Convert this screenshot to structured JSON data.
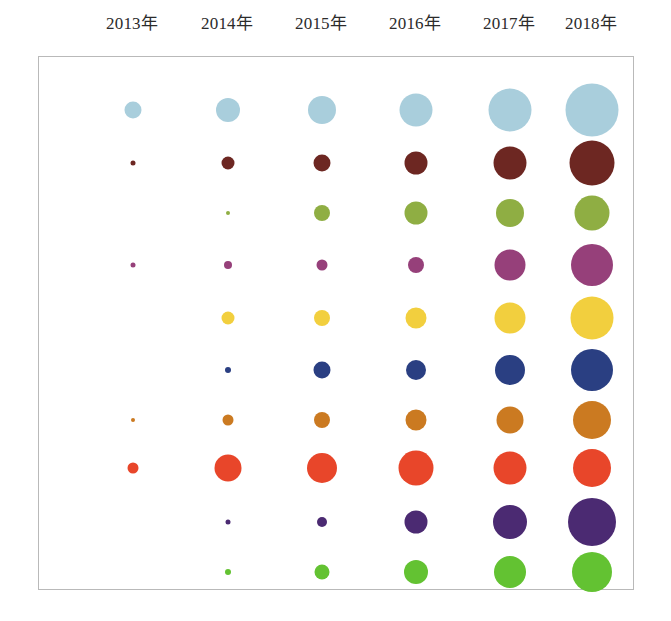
{
  "header": {
    "years": [
      "2013年",
      "2014年",
      "2015年",
      "2016年",
      "2017年",
      "2018年"
    ]
  },
  "chart_data": {
    "type": "scatter",
    "title": "",
    "subtitle": "",
    "xlabel": "",
    "ylabel": "",
    "legend_position": "none",
    "grid": false,
    "note": "Bubble matrix: 10 categories (rows) x 6 years (columns); marker area encodes magnitude",
    "categories": [
      "2013年",
      "2014年",
      "2015年",
      "2016年",
      "2017年",
      "2018年"
    ],
    "x_positions": [
      132,
      227,
      321,
      415,
      509,
      591
    ],
    "y_positions": [
      109,
      162,
      212,
      264,
      317,
      369,
      419,
      467,
      521,
      571
    ],
    "axis_ranges": {
      "x": [
        38,
        634
      ],
      "y": [
        56,
        590
      ]
    },
    "series": [
      {
        "name": "series-1",
        "color": "#a9cedc",
        "row": 1,
        "values": [
          17,
          24,
          28,
          33,
          43,
          53
        ],
        "diameters": [
          17,
          24,
          28,
          33,
          43,
          53
        ]
      },
      {
        "name": "series-2",
        "color": "#6d2722",
        "row": 2,
        "values": [
          5,
          13,
          17,
          23,
          33,
          45
        ],
        "diameters": [
          5,
          13,
          17,
          23,
          33,
          45
        ]
      },
      {
        "name": "series-3",
        "color": "#8fae43",
        "row": 3,
        "values": [
          0,
          4,
          16,
          23,
          28,
          35
        ],
        "diameters": [
          0,
          4,
          16,
          23,
          28,
          35
        ]
      },
      {
        "name": "series-4",
        "color": "#96407a",
        "row": 4,
        "values": [
          5,
          8,
          11,
          16,
          31,
          42
        ],
        "diameters": [
          5,
          8,
          11,
          16,
          31,
          42
        ]
      },
      {
        "name": "series-5",
        "color": "#f2cf3e",
        "row": 5,
        "values": [
          0,
          13,
          16,
          21,
          31,
          43
        ],
        "diameters": [
          0,
          13,
          16,
          21,
          31,
          43
        ]
      },
      {
        "name": "series-6",
        "color": "#2a3f82",
        "row": 6,
        "values": [
          0,
          6,
          17,
          20,
          30,
          42
        ],
        "diameters": [
          0,
          6,
          17,
          20,
          30,
          42
        ]
      },
      {
        "name": "series-7",
        "color": "#cb7a21",
        "row": 7,
        "values": [
          4,
          11,
          16,
          21,
          27,
          38
        ],
        "diameters": [
          4,
          11,
          16,
          21,
          27,
          38
        ]
      },
      {
        "name": "series-8",
        "color": "#e8462a",
        "row": 8,
        "values": [
          11,
          27,
          30,
          35,
          33,
          38
        ],
        "diameters": [
          11,
          27,
          30,
          35,
          33,
          38
        ]
      },
      {
        "name": "series-9",
        "color": "#4b2a72",
        "row": 9,
        "values": [
          0,
          5,
          10,
          23,
          34,
          48
        ],
        "diameters": [
          0,
          5,
          10,
          23,
          34,
          48
        ]
      },
      {
        "name": "series-10",
        "color": "#63c232",
        "row": 10,
        "values": [
          0,
          6,
          15,
          24,
          32,
          40
        ],
        "diameters": [
          0,
          6,
          15,
          24,
          32,
          40
        ]
      }
    ]
  },
  "style": {
    "frame_border_color": "#b9b9b9",
    "background": "#ffffff",
    "label_color": "#2b2b2b"
  }
}
